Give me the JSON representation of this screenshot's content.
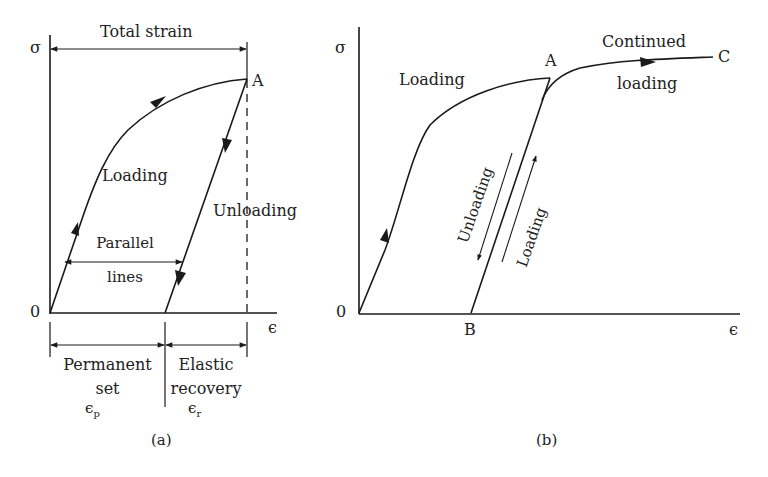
{
  "panel_a": {
    "caption": "(a)",
    "y_axis_label": "σ",
    "x_axis_label": "ϵ",
    "origin_label": "0",
    "point_a_label": "A",
    "total_strain_label": "Total strain",
    "loading_label": "Loading",
    "unloading_label": "Unloading",
    "parallel_label_line1": "Parallel",
    "parallel_label_line2": "lines",
    "permanent_line1": "Permanent",
    "permanent_line2": "set",
    "permanent_symbol": "ϵ",
    "permanent_sub": "p",
    "elastic_line1": "Elastic",
    "elastic_line2": "recovery",
    "elastic_symbol": "ϵ",
    "elastic_sub": "r"
  },
  "panel_b": {
    "caption": "(b)",
    "y_axis_label": "σ",
    "x_axis_label": "ϵ",
    "origin_label": "0",
    "point_a_label": "A",
    "point_b_label": "B",
    "point_c_label": "C",
    "loading_label": "Loading",
    "continued_line1": "Continued",
    "continued_line2": "loading",
    "unloading_rot_label": "Unloading",
    "reloading_rot_label": "Loading"
  },
  "colors": {
    "line": "#1a1a1a",
    "text": "#222222",
    "background": "#ffffff"
  }
}
